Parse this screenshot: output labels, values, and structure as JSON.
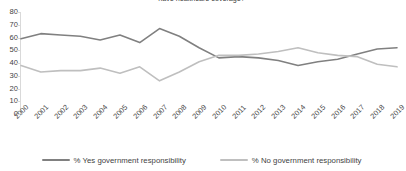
{
  "chart_data": {
    "type": "line",
    "title": "have healthcare coverage?",
    "xlabel": "",
    "ylabel": "",
    "ylim": [
      0,
      80
    ],
    "yticks": [
      80,
      70,
      60,
      50,
      40,
      30,
      20,
      10,
      0
    ],
    "grid": false,
    "legend_position": "bottom",
    "categories": [
      "2000",
      "2001",
      "2002",
      "2003",
      "2004",
      "2005",
      "2006",
      "2007",
      "2008",
      "2009",
      "2010",
      "2011",
      "2012",
      "2013",
      "2014",
      "2015",
      "2016",
      "2017",
      "2018",
      "2019"
    ],
    "series": [
      {
        "name": "% Yes government responsibility",
        "color": "#808080",
        "values": [
          59,
          63,
          62,
          61,
          58,
          62,
          56,
          67,
          61,
          52,
          44,
          45,
          44,
          42,
          38,
          41,
          43,
          47,
          51,
          52
        ]
      },
      {
        "name": "% No government responsibility",
        "color": "#bfbfbf",
        "values": [
          38,
          33,
          34,
          34,
          36,
          32,
          37,
          26,
          33,
          41,
          46,
          46,
          47,
          49,
          52,
          48,
          46,
          45,
          39,
          37
        ]
      }
    ]
  },
  "legend": {
    "items": [
      {
        "label": "% Yes government responsibility"
      },
      {
        "label": "% No government responsibility"
      }
    ]
  }
}
